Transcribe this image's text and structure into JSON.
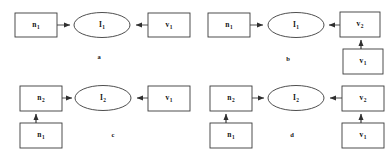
{
  "figure": {
    "caption_style": "lower-alpha",
    "stroke_color": "#3a3a3a",
    "text_color": "#141414",
    "background": "#ffffff"
  },
  "panels": [
    {
      "id": "a",
      "caption": "a",
      "nodes": [
        {
          "key": "n1",
          "base": "n",
          "sub": "1",
          "shape": "rect",
          "label": "n1"
        },
        {
          "key": "I1",
          "base": "I",
          "sub": "1",
          "shape": "ellipse",
          "label": "I1"
        },
        {
          "key": "v1",
          "base": "v",
          "sub": "1",
          "shape": "rect",
          "label": "v1"
        }
      ],
      "edges": [
        {
          "from": "n1",
          "to": "I1",
          "direction": "right"
        },
        {
          "from": "v1",
          "to": "I1",
          "direction": "left"
        }
      ]
    },
    {
      "id": "b",
      "caption": "b",
      "nodes": [
        {
          "key": "n1",
          "base": "n",
          "sub": "1",
          "shape": "rect",
          "label": "n1"
        },
        {
          "key": "I1",
          "base": "I",
          "sub": "1",
          "shape": "ellipse",
          "label": "I1"
        },
        {
          "key": "v2",
          "base": "v",
          "sub": "2",
          "shape": "rect",
          "label": "v2"
        },
        {
          "key": "v1",
          "base": "v",
          "sub": "1",
          "shape": "rect",
          "label": "v1"
        }
      ],
      "edges": [
        {
          "from": "n1",
          "to": "I1",
          "direction": "right"
        },
        {
          "from": "v2",
          "to": "I1",
          "direction": "left"
        },
        {
          "from": "v1",
          "to": "v2",
          "direction": "up"
        }
      ]
    },
    {
      "id": "c",
      "caption": "c",
      "nodes": [
        {
          "key": "n2",
          "base": "n",
          "sub": "2",
          "shape": "rect",
          "label": "n2"
        },
        {
          "key": "I2",
          "base": "I",
          "sub": "2",
          "shape": "ellipse",
          "label": "I2"
        },
        {
          "key": "v1",
          "base": "v",
          "sub": "1",
          "shape": "rect",
          "label": "v1"
        },
        {
          "key": "n1",
          "base": "n",
          "sub": "1",
          "shape": "rect",
          "label": "n1"
        }
      ],
      "edges": [
        {
          "from": "n2",
          "to": "I2",
          "direction": "right"
        },
        {
          "from": "v1",
          "to": "I2",
          "direction": "left"
        },
        {
          "from": "n1",
          "to": "n2",
          "direction": "up"
        }
      ]
    },
    {
      "id": "d",
      "caption": "d",
      "nodes": [
        {
          "key": "n2",
          "base": "n",
          "sub": "2",
          "shape": "rect",
          "label": "n2"
        },
        {
          "key": "I2",
          "base": "I",
          "sub": "2",
          "shape": "ellipse",
          "label": "I2"
        },
        {
          "key": "v2",
          "base": "v",
          "sub": "2",
          "shape": "rect",
          "label": "v2"
        },
        {
          "key": "n1",
          "base": "n",
          "sub": "1",
          "shape": "rect",
          "label": "n1"
        },
        {
          "key": "v1",
          "base": "v",
          "sub": "1",
          "shape": "rect",
          "label": "v1"
        }
      ],
      "edges": [
        {
          "from": "n2",
          "to": "I2",
          "direction": "right"
        },
        {
          "from": "v2",
          "to": "I2",
          "direction": "left"
        },
        {
          "from": "n1",
          "to": "n2",
          "direction": "up"
        },
        {
          "from": "v1",
          "to": "v2",
          "direction": "up"
        }
      ]
    }
  ]
}
